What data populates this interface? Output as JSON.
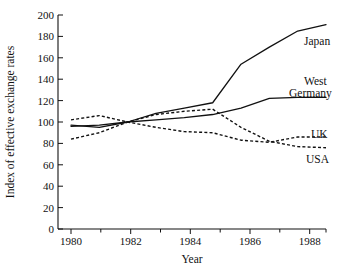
{
  "chart_data": {
    "type": "line",
    "title": "",
    "xlabel": "Year",
    "ylabel": "Index of effective exchange rates",
    "xlim": [
      1980,
      1989
    ],
    "ylim": [
      0,
      200
    ],
    "xticks": [
      1980,
      1982,
      1984,
      1986,
      1988
    ],
    "xtick_labels": [
      "1980",
      "1982",
      "1984",
      "1986",
      "1988"
    ],
    "xminor_ticks": [
      1981,
      1983,
      1985,
      1987,
      1989
    ],
    "yticks": [
      0,
      20,
      40,
      60,
      80,
      100,
      120,
      140,
      160,
      180,
      200
    ],
    "ytick_labels": [
      "0",
      "20",
      "40",
      "60",
      "80",
      "100",
      "120",
      "140",
      "160",
      "180",
      "200"
    ],
    "grid": false,
    "legend_position": "right-inline-labels",
    "x": [
      1980,
      1981,
      1982,
      1983,
      1984,
      1985,
      1986,
      1987,
      1988,
      1989
    ],
    "series": [
      {
        "name": "Japan",
        "style": "solid",
        "label": "Japan",
        "values": [
          97,
          95,
          100,
          108,
          113,
          118,
          154,
          170,
          185,
          191
        ]
      },
      {
        "name": "West Germany",
        "style": "solid",
        "label": "West Germany",
        "label_line1": "West",
        "label_line2": "Germany",
        "values": [
          96,
          97,
          100,
          102,
          104,
          107,
          113,
          122,
          123,
          123
        ]
      },
      {
        "name": "UK",
        "style": "dashed",
        "label": "UK",
        "values": [
          102,
          106,
          100,
          95,
          91,
          90,
          83,
          81,
          86,
          86
        ]
      },
      {
        "name": "USA",
        "style": "dashed",
        "label": "USA",
        "values": [
          84,
          90,
          100,
          107,
          110,
          112,
          95,
          82,
          77,
          76
        ]
      }
    ]
  },
  "axes": {
    "y_title": "Index of effective exchange rates",
    "x_title": "Year"
  },
  "series_labels": {
    "japan": "Japan",
    "west": "West",
    "germany": "Germany",
    "uk": "UK",
    "usa": "USA"
  }
}
